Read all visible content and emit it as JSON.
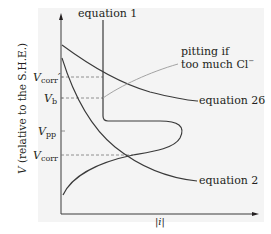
{
  "diagram": {
    "y_axis_label_symbol": "V",
    "y_axis_label_rest": " (relative to the S.H.E.)",
    "x_axis_label": "|i|",
    "curve_labels": {
      "equation1": "equation 1",
      "equation26": "equation 26",
      "equation2": "equation 2"
    },
    "annotation": {
      "line1": "pitting if",
      "line2": "too much Cl",
      "superscript": "−"
    },
    "potentials": [
      {
        "symbol": "V",
        "subscript": "corr",
        "prime": "′",
        "y": 77
      },
      {
        "symbol": "V",
        "subscript": "b",
        "prime": "",
        "y": 98
      },
      {
        "symbol": "V",
        "subscript": "pp",
        "prime": "",
        "y": 131
      },
      {
        "symbol": "V",
        "subscript": "corr",
        "prime": "",
        "y": 155
      }
    ],
    "colors": {
      "curve": "#3a3a3a",
      "pitting_line": "#9a9a9a",
      "dashed": "#777777",
      "background": "#f4f4f4"
    }
  }
}
